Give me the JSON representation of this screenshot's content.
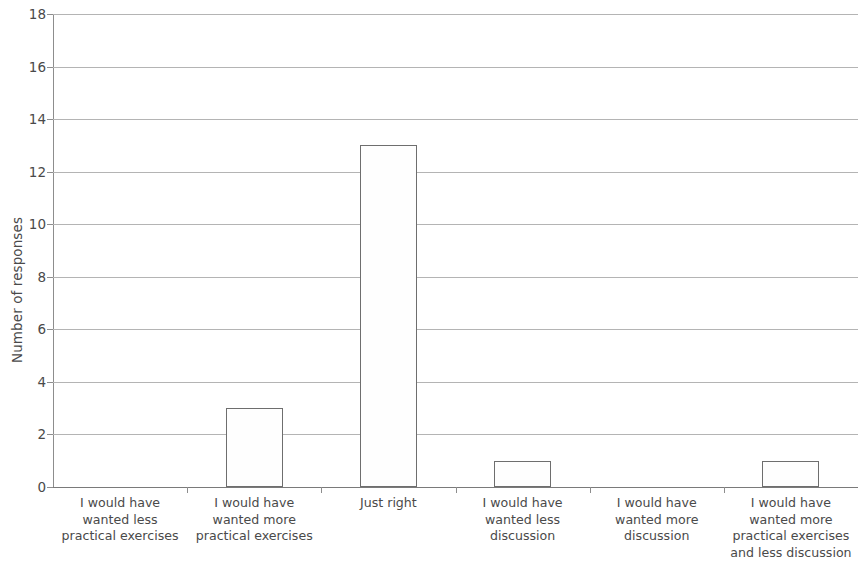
{
  "chart_data": {
    "type": "bar",
    "title": "",
    "subtitle": "",
    "xlabel": "",
    "ylabel": "Number of responses",
    "ylim": [
      0,
      18
    ],
    "ytick_step": 2,
    "yticks": [
      0,
      2,
      4,
      6,
      8,
      10,
      12,
      14,
      16,
      18
    ],
    "ytick_labels": [
      "0",
      "2",
      "4",
      "6",
      "8",
      "10",
      "12",
      "14",
      "16",
      "18"
    ],
    "grid": "horizontal",
    "legend": "none",
    "categories": [
      "I would have wanted less practical exercises",
      "I would have wanted more practical exercises",
      "Just right",
      "I would have wanted less discussion",
      "I would have wanted more discussion",
      "I would have wanted more practical exercises and less discussion"
    ],
    "category_label_lines": [
      [
        "I would have",
        "wanted less",
        "practical exercises"
      ],
      [
        "I would have",
        "wanted more",
        "practical exercises"
      ],
      [
        "Just right"
      ],
      [
        "I would have",
        "wanted less",
        "discussion"
      ],
      [
        "I would have",
        "wanted more",
        "discussion"
      ],
      [
        "I would have",
        "wanted more",
        "practical exercises",
        "and less discussion"
      ]
    ],
    "values": [
      0,
      3,
      13,
      1,
      0,
      1
    ],
    "bar_fill": "#fefefe",
    "bar_border": "#6e6e6e",
    "gridline_color": "#b4b4b4",
    "axis_color": "#8d8d8d",
    "text_color": "#4a4a4a"
  }
}
